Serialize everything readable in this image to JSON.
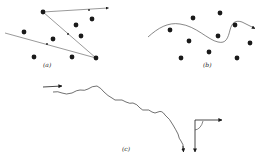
{
  "figure": {
    "panels": [
      {
        "id": "a",
        "label": "(a)",
        "description": "Straight-line trajectory between scattering particles",
        "dots": [
          [
            43,
            12
          ],
          [
            92,
            19
          ],
          [
            24,
            32
          ],
          [
            76,
            25
          ],
          [
            81,
            36
          ],
          [
            53,
            39
          ],
          [
            34,
            57
          ],
          [
            72,
            57
          ],
          [
            96,
            58
          ]
        ],
        "path": [
          [
            5,
            33
          ],
          [
            96,
            58
          ],
          [
            43,
            12
          ],
          [
            108,
            8
          ]
        ],
        "arrows": [
          [
            47,
            44
          ],
          [
            68,
            34
          ],
          [
            89,
            10
          ]
        ]
      },
      {
        "id": "b",
        "label": "(b)",
        "description": "Curved trajectory through a field of particles",
        "dots": [
          [
            193,
            18
          ],
          [
            220,
            13
          ],
          [
            170,
            30
          ],
          [
            235,
            25
          ],
          [
            189,
            41
          ],
          [
            218,
            36
          ],
          [
            209,
            52
          ],
          [
            250,
            43
          ],
          [
            181,
            58
          ],
          [
            237,
            58
          ]
        ]
      },
      {
        "id": "c",
        "label": "(c)",
        "description": "Random walk path with incoming arrow and orthogonal output arrows"
      }
    ],
    "colors": {
      "ink": "#1a1a1a",
      "line": "#555555",
      "background": "#ffffff"
    }
  }
}
